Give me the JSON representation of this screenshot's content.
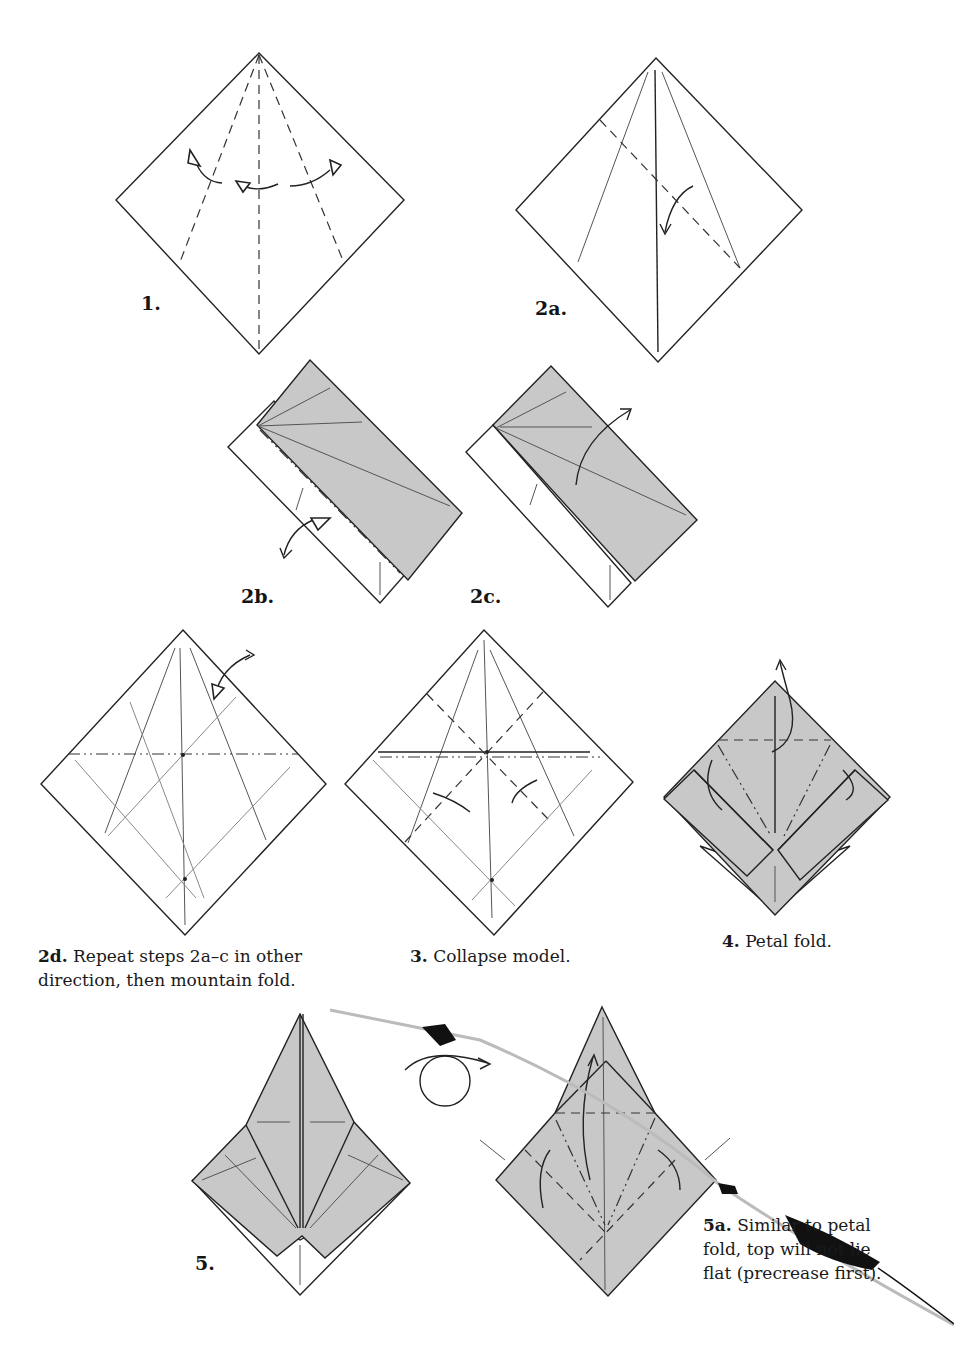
{
  "page": {
    "type": "origami instruction diagrams",
    "paper_colors": {
      "white_side": "#ffffff",
      "colored_side": "#c8c8c8",
      "ink": "#222222"
    }
  },
  "steps": [
    {
      "id": "1",
      "label": "1.",
      "caption": ""
    },
    {
      "id": "2a",
      "label": "2a.",
      "caption": ""
    },
    {
      "id": "2b",
      "label": "2b.",
      "caption": ""
    },
    {
      "id": "2c",
      "label": "2c.",
      "caption": ""
    },
    {
      "id": "2d",
      "label": "2d.",
      "caption": "Repeat steps 2a–c in other direction, then mountain fold."
    },
    {
      "id": "3",
      "label": "3.",
      "caption": "Collapse model."
    },
    {
      "id": "4",
      "label": "4.",
      "caption": "Petal fold."
    },
    {
      "id": "5",
      "label": "5.",
      "caption": ""
    },
    {
      "id": "5a",
      "label": "5a.",
      "caption": "Similar to petal fold, top will not lie flat (precrease first)."
    }
  ]
}
